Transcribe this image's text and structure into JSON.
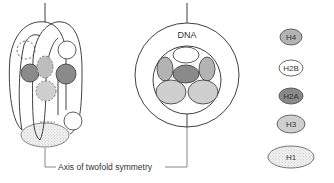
{
  "diagram": {
    "dna_label": "DNA",
    "axis_label": "Axis of twofold symmetry",
    "legend": [
      {
        "id": "H4",
        "label": "H4",
        "fill": "#b3b3b3",
        "pattern": "solid"
      },
      {
        "id": "H2B",
        "label": "H2B",
        "fill": "#ffffff",
        "pattern": "solid"
      },
      {
        "id": "H2A",
        "label": "H2A",
        "fill": "#8a8a8a",
        "pattern": "solid"
      },
      {
        "id": "H3",
        "label": "H3",
        "fill": "#cfcfcf",
        "pattern": "solid"
      },
      {
        "id": "H1",
        "label": "H1",
        "fill": "#ececec",
        "pattern": "stipple"
      }
    ],
    "colors": {
      "line": "#2a2a2a",
      "text": "#333333"
    }
  }
}
